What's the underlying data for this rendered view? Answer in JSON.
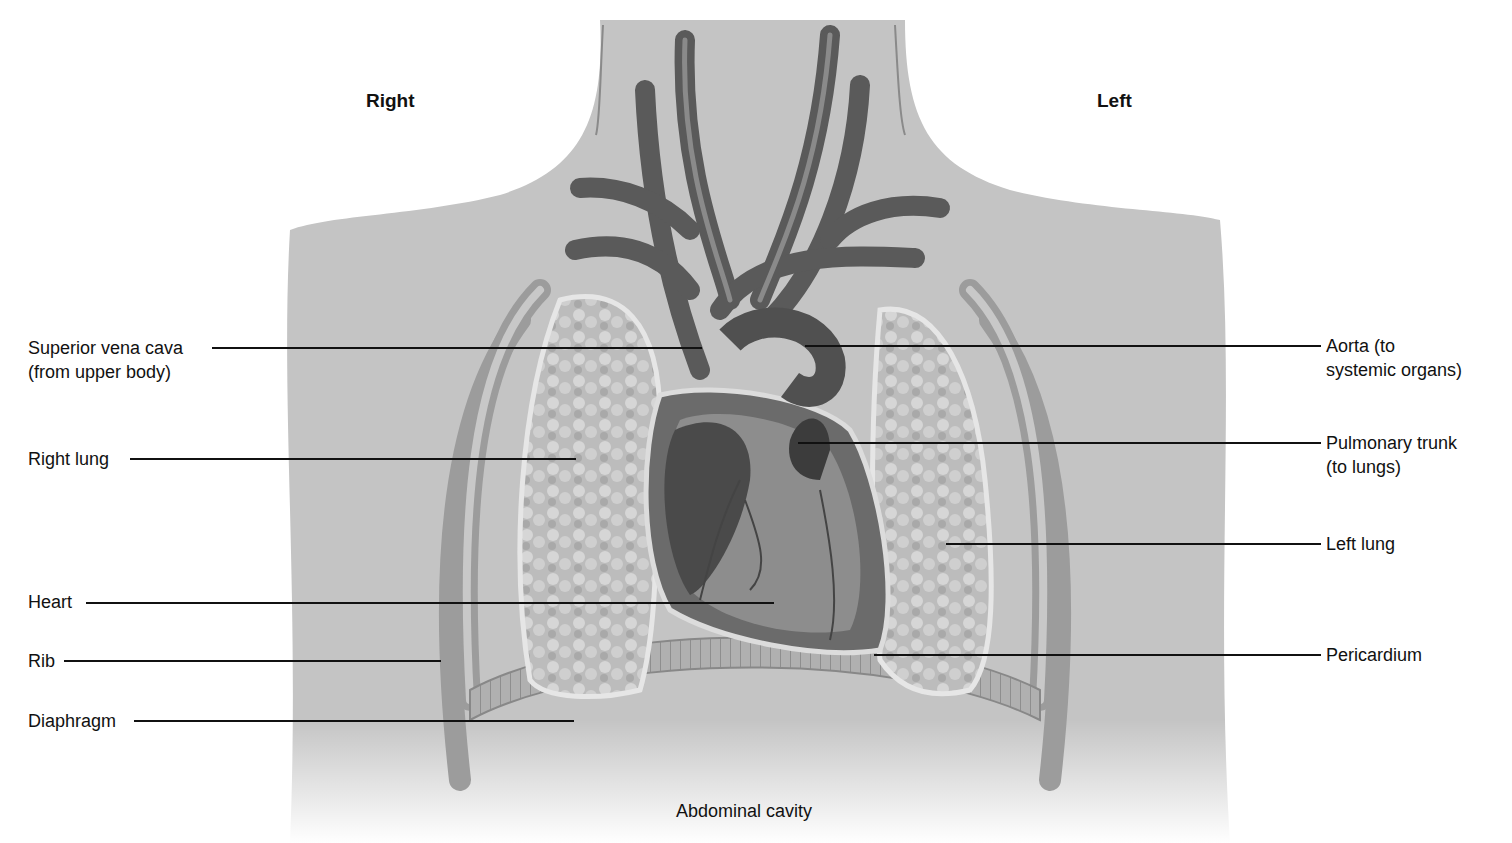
{
  "diagram": {
    "orientation": {
      "right": "Right",
      "left": "Left"
    },
    "bottom_label": "Abdominal cavity",
    "labels_left": [
      {
        "line1": "Superior vena cava",
        "line2": "(from upper body)"
      },
      {
        "line1": "Right lung"
      },
      {
        "line1": "Heart"
      },
      {
        "line1": "Rib"
      },
      {
        "line1": "Diaphragm"
      }
    ],
    "labels_right": [
      {
        "line1": "Aorta (to",
        "line2": "systemic organs)"
      },
      {
        "line1": "Pulmonary trunk",
        "line2": "(to lungs)"
      },
      {
        "line1": "Left lung"
      },
      {
        "line1": "Pericardium"
      }
    ],
    "colors": {
      "skin": "#c9c9c9",
      "skin_shadow": "#a8a8a8",
      "vessel": "#555555",
      "lung": "#b9b9b9",
      "heart": "#6a6a6a",
      "leader": "#111111"
    }
  }
}
